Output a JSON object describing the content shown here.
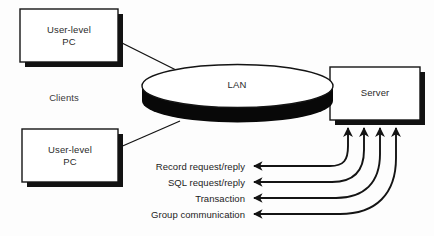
{
  "diagram": {
    "background_color": "#fdfdfd",
    "line_color": "#141414",
    "fill_color": "#ffffff",
    "shadow_color": "#121212",
    "text_color": "#2b2b2b"
  },
  "nodes": {
    "client_top": {
      "label": "User-level\nPC",
      "shape": "rectangle-with-shadow"
    },
    "client_bottom": {
      "label": "User-level\nPC",
      "shape": "rectangle-with-shadow"
    },
    "network": {
      "label": "LAN",
      "shape": "cylinder-disk"
    },
    "server": {
      "label": "Server",
      "shape": "rectangle-with-shadow"
    }
  },
  "groups": {
    "clients": {
      "label": "Clients"
    }
  },
  "flows": [
    {
      "label": "Record request/reply"
    },
    {
      "label": "SQL request/reply"
    },
    {
      "label": "Transaction"
    },
    {
      "label": "Group communication"
    }
  ],
  "connections": [
    {
      "from": "client_top",
      "to": "network",
      "style": "straight-line"
    },
    {
      "from": "client_bottom",
      "to": "network",
      "style": "straight-line"
    },
    {
      "from": "server",
      "to": "flow_record",
      "style": "curved-double-arrow"
    },
    {
      "from": "server",
      "to": "flow_sql",
      "style": "curved-double-arrow"
    },
    {
      "from": "server",
      "to": "flow_transaction",
      "style": "curved-double-arrow"
    },
    {
      "from": "server",
      "to": "flow_group",
      "style": "curved-double-arrow"
    }
  ]
}
